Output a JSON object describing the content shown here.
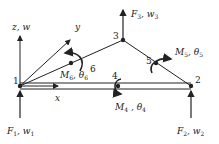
{
  "diagram": {
    "type": "plate-element-nodal-diagram",
    "axes": {
      "z_label": "z, w",
      "y_label": "y",
      "x_label": "x"
    },
    "nodes": [
      {
        "id": "1",
        "label": "1"
      },
      {
        "id": "2",
        "label": "2"
      },
      {
        "id": "3",
        "label": "3"
      },
      {
        "id": "4",
        "label": "4"
      },
      {
        "id": "5",
        "label": "5"
      },
      {
        "id": "6",
        "label": "6"
      }
    ],
    "forces": [
      {
        "node": "1",
        "label": "F",
        "sub": "1",
        "var": "w",
        "varsub": "1"
      },
      {
        "node": "2",
        "label": "F",
        "sub": "2",
        "var": "w",
        "varsub": "2"
      },
      {
        "node": "3",
        "label": "F",
        "sub": "3",
        "var": "w",
        "varsub": "3"
      }
    ],
    "moments": [
      {
        "node": "4",
        "label": "M",
        "sub": "4",
        "var": "θ",
        "varsub": "4"
      },
      {
        "node": "5",
        "label": "M",
        "sub": "5",
        "var": "θ",
        "varsub": "5"
      },
      {
        "node": "6",
        "label": "M",
        "sub": "6",
        "var": "θ",
        "varsub": "6"
      }
    ],
    "colors": {
      "line": "#222222",
      "background": "#ffffff"
    }
  }
}
